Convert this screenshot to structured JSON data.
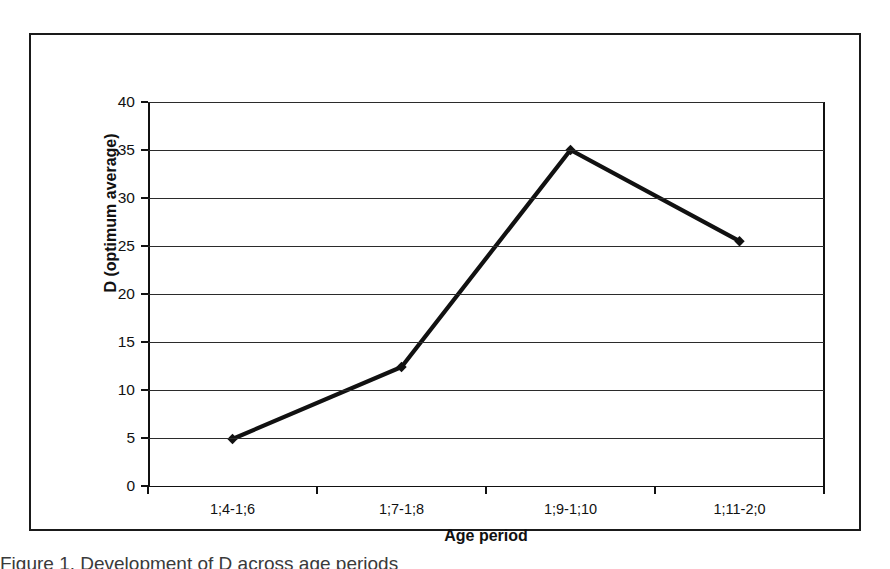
{
  "figure": {
    "caption_partial": "Figure 1. Development of D across age periods"
  },
  "chart_data": {
    "type": "line",
    "title": "",
    "xlabel": "Age period",
    "ylabel": "D (optimum average)",
    "categories": [
      "1;4-1;6",
      "1;7-1;8",
      "1;9-1;10",
      "1;11-2;0"
    ],
    "values": [
      4.9,
      12.4,
      35.0,
      25.5
    ],
    "series": [
      {
        "name": "D (optimum average)",
        "values": [
          4.9,
          12.4,
          35.0,
          25.5
        ]
      }
    ],
    "ylim": [
      0,
      40
    ],
    "ytick_labels": [
      "0",
      "5",
      "10",
      "15",
      "20",
      "25",
      "30",
      "35",
      "40"
    ],
    "ytick_values": [
      0,
      5,
      10,
      15,
      20,
      25,
      30,
      35,
      40
    ],
    "grid": "horizontal",
    "legend": "none",
    "line_color": "#111111",
    "marker": "diamond",
    "marker_color": "#111111",
    "gridline_color": "#2b2b2b",
    "background_color": "#ffffff"
  }
}
